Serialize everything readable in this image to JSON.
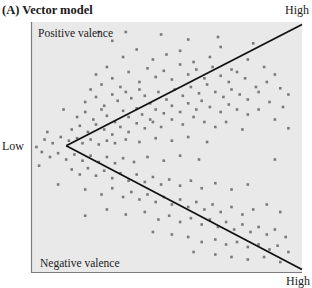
{
  "chart_data": {
    "type": "scatter",
    "title": "(A) Vector model",
    "xlabel_low": "Low",
    "xlabel_high_top": "High",
    "xlabel_high_bottom": "High",
    "region_labels": {
      "upper": "Positive valence",
      "lower": "Negative valence"
    },
    "xlabel": "Arousal",
    "ylabel": "Valence",
    "xlim": [
      0,
      1
    ],
    "ylim": [
      -1,
      1
    ],
    "grid": false,
    "legend": "none",
    "vectors": [
      {
        "name": "positive-valence-vector",
        "from": [
          0.13,
          0.01
        ],
        "to": [
          1.0,
          0.98
        ]
      },
      {
        "name": "negative-valence-vector",
        "from": [
          0.13,
          0.01
        ],
        "to": [
          1.0,
          -0.98
        ]
      }
    ],
    "colors": {
      "points": "#7a7a7a",
      "vectors": "#111111",
      "background": "#e9e9e9",
      "axis": "#7d7d7d"
    },
    "points": [
      [
        0.24,
        0.58
      ],
      [
        0.28,
        0.64
      ],
      [
        0.34,
        0.72
      ],
      [
        0.39,
        0.78
      ],
      [
        0.45,
        0.7
      ],
      [
        0.5,
        0.74
      ],
      [
        0.55,
        0.77
      ],
      [
        0.6,
        0.68
      ],
      [
        0.66,
        0.72
      ],
      [
        0.7,
        0.8
      ],
      [
        0.74,
        0.62
      ],
      [
        0.8,
        0.7
      ],
      [
        0.86,
        0.64
      ],
      [
        0.9,
        0.58
      ],
      [
        0.22,
        0.46
      ],
      [
        0.26,
        0.5
      ],
      [
        0.3,
        0.55
      ],
      [
        0.33,
        0.48
      ],
      [
        0.36,
        0.6
      ],
      [
        0.4,
        0.52
      ],
      [
        0.43,
        0.63
      ],
      [
        0.46,
        0.56
      ],
      [
        0.49,
        0.61
      ],
      [
        0.52,
        0.54
      ],
      [
        0.55,
        0.66
      ],
      [
        0.58,
        0.58
      ],
      [
        0.61,
        0.62
      ],
      [
        0.64,
        0.55
      ],
      [
        0.67,
        0.64
      ],
      [
        0.7,
        0.57
      ],
      [
        0.73,
        0.52
      ],
      [
        0.76,
        0.6
      ],
      [
        0.79,
        0.55
      ],
      [
        0.83,
        0.48
      ],
      [
        0.87,
        0.52
      ],
      [
        0.92,
        0.47
      ],
      [
        0.95,
        0.42
      ],
      [
        0.2,
        0.36
      ],
      [
        0.24,
        0.4
      ],
      [
        0.27,
        0.33
      ],
      [
        0.3,
        0.42
      ],
      [
        0.32,
        0.37
      ],
      [
        0.35,
        0.44
      ],
      [
        0.37,
        0.39
      ],
      [
        0.4,
        0.46
      ],
      [
        0.42,
        0.41
      ],
      [
        0.44,
        0.35
      ],
      [
        0.47,
        0.44
      ],
      [
        0.5,
        0.38
      ],
      [
        0.53,
        0.46
      ],
      [
        0.56,
        0.41
      ],
      [
        0.59,
        0.48
      ],
      [
        0.62,
        0.43
      ],
      [
        0.65,
        0.5
      ],
      [
        0.68,
        0.44
      ],
      [
        0.71,
        0.4
      ],
      [
        0.74,
        0.46
      ],
      [
        0.77,
        0.42
      ],
      [
        0.8,
        0.38
      ],
      [
        0.84,
        0.44
      ],
      [
        0.88,
        0.36
      ],
      [
        0.93,
        0.32
      ],
      [
        0.17,
        0.24
      ],
      [
        0.2,
        0.28
      ],
      [
        0.23,
        0.22
      ],
      [
        0.26,
        0.3
      ],
      [
        0.28,
        0.25
      ],
      [
        0.31,
        0.2
      ],
      [
        0.34,
        0.29
      ],
      [
        0.36,
        0.24
      ],
      [
        0.39,
        0.31
      ],
      [
        0.41,
        0.26
      ],
      [
        0.44,
        0.22
      ],
      [
        0.46,
        0.3
      ],
      [
        0.49,
        0.27
      ],
      [
        0.52,
        0.33
      ],
      [
        0.55,
        0.28
      ],
      [
        0.58,
        0.35
      ],
      [
        0.61,
        0.3
      ],
      [
        0.63,
        0.37
      ],
      [
        0.66,
        0.32
      ],
      [
        0.7,
        0.28
      ],
      [
        0.73,
        0.34
      ],
      [
        0.76,
        0.3
      ],
      [
        0.8,
        0.26
      ],
      [
        0.84,
        0.3
      ],
      [
        0.9,
        0.22
      ],
      [
        0.15,
        0.14
      ],
      [
        0.18,
        0.17
      ],
      [
        0.21,
        0.12
      ],
      [
        0.24,
        0.18
      ],
      [
        0.27,
        0.14
      ],
      [
        0.3,
        0.1
      ],
      [
        0.33,
        0.16
      ],
      [
        0.36,
        0.12
      ],
      [
        0.39,
        0.19
      ],
      [
        0.42,
        0.15
      ],
      [
        0.45,
        0.2
      ],
      [
        0.48,
        0.16
      ],
      [
        0.52,
        0.22
      ],
      [
        0.56,
        0.18
      ],
      [
        0.6,
        0.24
      ],
      [
        0.64,
        0.2
      ],
      [
        0.68,
        0.16
      ],
      [
        0.72,
        0.2
      ],
      [
        0.78,
        0.14
      ],
      [
        0.02,
        0.0
      ],
      [
        0.05,
        0.06
      ],
      [
        0.08,
        0.03
      ],
      [
        0.11,
        0.08
      ],
      [
        0.14,
        0.05
      ],
      [
        0.17,
        0.07
      ],
      [
        0.19,
        0.03
      ],
      [
        0.22,
        0.06
      ],
      [
        0.25,
        0.02
      ],
      [
        0.28,
        0.05
      ],
      [
        0.31,
        0.03
      ],
      [
        0.35,
        0.06
      ],
      [
        0.4,
        0.04
      ],
      [
        0.46,
        0.07
      ],
      [
        0.52,
        0.05
      ],
      [
        0.58,
        0.08
      ],
      [
        0.65,
        0.04
      ],
      [
        0.04,
        -0.04
      ],
      [
        0.07,
        -0.08
      ],
      [
        0.1,
        -0.05
      ],
      [
        0.13,
        -0.1
      ],
      [
        0.16,
        -0.06
      ],
      [
        0.19,
        -0.11
      ],
      [
        0.22,
        -0.07
      ],
      [
        0.25,
        -0.12
      ],
      [
        0.28,
        -0.08
      ],
      [
        0.31,
        -0.13
      ],
      [
        0.34,
        -0.09
      ],
      [
        0.38,
        -0.12
      ],
      [
        0.43,
        -0.08
      ],
      [
        0.49,
        -0.11
      ],
      [
        0.55,
        -0.07
      ],
      [
        0.62,
        -0.1
      ],
      [
        0.15,
        -0.18
      ],
      [
        0.18,
        -0.22
      ],
      [
        0.21,
        -0.17
      ],
      [
        0.24,
        -0.23
      ],
      [
        0.27,
        -0.19
      ],
      [
        0.3,
        -0.25
      ],
      [
        0.33,
        -0.21
      ],
      [
        0.36,
        -0.27
      ],
      [
        0.39,
        -0.22
      ],
      [
        0.42,
        -0.28
      ],
      [
        0.45,
        -0.24
      ],
      [
        0.48,
        -0.3
      ],
      [
        0.51,
        -0.26
      ],
      [
        0.55,
        -0.31
      ],
      [
        0.59,
        -0.27
      ],
      [
        0.63,
        -0.33
      ],
      [
        0.68,
        -0.29
      ],
      [
        0.74,
        -0.34
      ],
      [
        0.8,
        -0.3
      ],
      [
        0.2,
        -0.34
      ],
      [
        0.26,
        -0.38
      ],
      [
        0.3,
        -0.33
      ],
      [
        0.34,
        -0.4
      ],
      [
        0.37,
        -0.36
      ],
      [
        0.4,
        -0.42
      ],
      [
        0.43,
        -0.38
      ],
      [
        0.46,
        -0.44
      ],
      [
        0.49,
        -0.4
      ],
      [
        0.52,
        -0.46
      ],
      [
        0.55,
        -0.42
      ],
      [
        0.58,
        -0.48
      ],
      [
        0.61,
        -0.44
      ],
      [
        0.64,
        -0.5
      ],
      [
        0.67,
        -0.46
      ],
      [
        0.7,
        -0.52
      ],
      [
        0.74,
        -0.48
      ],
      [
        0.78,
        -0.54
      ],
      [
        0.82,
        -0.5
      ],
      [
        0.87,
        -0.46
      ],
      [
        0.92,
        -0.52
      ],
      [
        0.28,
        -0.5
      ],
      [
        0.35,
        -0.54
      ],
      [
        0.42,
        -0.52
      ],
      [
        0.47,
        -0.58
      ],
      [
        0.51,
        -0.55
      ],
      [
        0.55,
        -0.6
      ],
      [
        0.59,
        -0.57
      ],
      [
        0.63,
        -0.62
      ],
      [
        0.66,
        -0.58
      ],
      [
        0.69,
        -0.64
      ],
      [
        0.72,
        -0.6
      ],
      [
        0.75,
        -0.66
      ],
      [
        0.78,
        -0.62
      ],
      [
        0.81,
        -0.68
      ],
      [
        0.84,
        -0.64
      ],
      [
        0.87,
        -0.7
      ],
      [
        0.9,
        -0.66
      ],
      [
        0.94,
        -0.72
      ],
      [
        0.45,
        -0.68
      ],
      [
        0.52,
        -0.7
      ],
      [
        0.58,
        -0.72
      ],
      [
        0.63,
        -0.76
      ],
      [
        0.68,
        -0.74
      ],
      [
        0.72,
        -0.78
      ],
      [
        0.76,
        -0.76
      ],
      [
        0.8,
        -0.8
      ],
      [
        0.84,
        -0.78
      ],
      [
        0.88,
        -0.82
      ],
      [
        0.91,
        -0.79
      ],
      [
        0.95,
        -0.84
      ],
      [
        0.6,
        -0.84
      ],
      [
        0.68,
        -0.86
      ],
      [
        0.74,
        -0.88
      ],
      [
        0.8,
        -0.9
      ],
      [
        0.86,
        -0.88
      ],
      [
        0.92,
        -0.92
      ],
      [
        0.25,
        0.92
      ],
      [
        0.3,
        0.85
      ],
      [
        0.48,
        0.9
      ],
      [
        0.58,
        0.86
      ],
      [
        0.69,
        0.88
      ],
      [
        0.82,
        0.83
      ],
      [
        0.95,
        0.15
      ],
      [
        0.9,
        -0.1
      ],
      [
        0.03,
        -0.15
      ],
      [
        0.06,
        0.12
      ],
      [
        0.35,
        0.92
      ],
      [
        0.12,
        0.3
      ],
      [
        0.1,
        -0.3
      ],
      [
        0.2,
        -0.55
      ]
    ]
  }
}
